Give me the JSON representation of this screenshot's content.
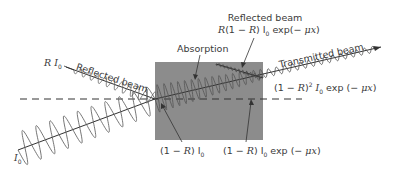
{
  "diagram": {
    "colors": {
      "slab_fill": "#8c8c8c",
      "beam_stroke": "#555555",
      "axis_stroke": "#333333",
      "text": "#3a3a3a"
    },
    "labels": {
      "incident_intensity": "I",
      "incident_subscript": "0",
      "reflected_front_prefix": "R I",
      "reflected_front_subscript": "0",
      "reflected_front_caption": "Reflected beam",
      "absorption": "Absorption",
      "reflected_back_caption": "Reflected beam",
      "reflected_back_formula_a": "R",
      "reflected_back_formula_b": "(1 − ",
      "reflected_back_formula_c": "R",
      "reflected_back_formula_d": ") I",
      "reflected_back_formula_sub": "0",
      "reflected_back_formula_e": " exp(− ",
      "reflected_back_formula_mu": "μx",
      "reflected_back_formula_f": ")",
      "transmitted_caption": "Transmitted beam",
      "transmitted_formula_a": "(1 − ",
      "transmitted_formula_r": "R",
      "transmitted_formula_b": ")",
      "transmitted_formula_sup": "2",
      "transmitted_formula_c": " I",
      "transmitted_formula_sub": "0",
      "transmitted_formula_d": " exp (− ",
      "transmitted_formula_mu": "μx",
      "transmitted_formula_e": ")",
      "entry_formula_a": "(1 − ",
      "entry_formula_r": "R",
      "entry_formula_b": ") I",
      "entry_formula_sub": "0",
      "exit_formula_a": "(1 − ",
      "exit_formula_r": "R",
      "exit_formula_b": ") I",
      "exit_formula_sub": "0",
      "exit_formula_c": " exp (− ",
      "exit_formula_mu": "μx",
      "exit_formula_d": ")"
    }
  }
}
